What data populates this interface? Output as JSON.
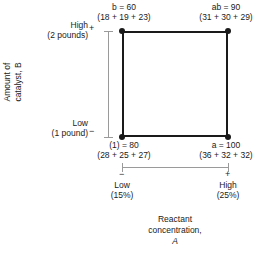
{
  "figure": {
    "type": "2^2 factorial design square"
  },
  "chart_data": {
    "type": "scatter",
    "title": "",
    "xlabel": "Reactant concentration, A",
    "ylabel": "Amount of catalyst, B",
    "grid": false,
    "legend": "none",
    "x_levels": [
      {
        "sign": "−",
        "name": "Low",
        "value": "(15%)"
      },
      {
        "sign": "+",
        "name": "High",
        "value": "(25%)"
      }
    ],
    "y_levels": [
      {
        "sign": "−",
        "name": "Low",
        "value": "(1 pound)"
      },
      {
        "sign": "+",
        "name": "High",
        "value": "(2 pounds)"
      }
    ],
    "points": [
      {
        "corner": "bottom-left",
        "x": "Low (15%)",
        "y": "Low (1 pound)",
        "label": "(1) = 80",
        "replicates": "(28 + 25 + 27)",
        "total": 80,
        "values": [
          28,
          25,
          27
        ]
      },
      {
        "corner": "bottom-right",
        "x": "High (25%)",
        "y": "Low (1 pound)",
        "label": "a = 100",
        "replicates": "(36 + 32 + 32)",
        "total": 100,
        "values": [
          36,
          32,
          32
        ]
      },
      {
        "corner": "top-left",
        "x": "Low (15%)",
        "y": "High (2 pounds)",
        "label": "b = 60",
        "replicates": "(18 + 19 + 23)",
        "total": 60,
        "values": [
          18,
          19,
          23
        ]
      },
      {
        "corner": "top-right",
        "x": "High (25%)",
        "y": "High (2 pounds)",
        "label": "ab = 90",
        "replicates": "(31 + 30 + 29)",
        "total": 90,
        "values": [
          31,
          30,
          29
        ]
      }
    ]
  },
  "labels": {
    "top_left_value": "b = 60",
    "top_left_reps": "(18 + 19 + 23)",
    "top_right_value": "ab = 90",
    "top_right_reps": "(31 + 30 + 29)",
    "bottom_left_value": "(1) = 80",
    "bottom_left_reps": "(28 + 25 + 27)",
    "bottom_right_value": "a = 100",
    "bottom_right_reps": "(36 + 32 + 32)",
    "b_high_name": "High",
    "b_high_value": "(2 pounds)",
    "b_high_sign": "+",
    "b_low_name": "Low",
    "b_low_value": "(1 pound)",
    "b_low_sign": "−",
    "a_low_name": "Low",
    "a_low_value": "(15%)",
    "a_low_sign": "−",
    "a_high_name": "High",
    "a_high_value": "(25%)",
    "a_high_sign": "+",
    "y_axis_line1": "Amount of",
    "y_axis_line2": "catalyst, B",
    "y_axis_factor": "B",
    "x_axis_line1": "Reactant",
    "x_axis_line2": "concentration,",
    "x_axis_factor": "A"
  },
  "colors": {
    "square_stroke": "#1a1a1a",
    "axis_gray": "#9a9a9a",
    "text": "#1a1a1a",
    "background": "#ffffff"
  }
}
